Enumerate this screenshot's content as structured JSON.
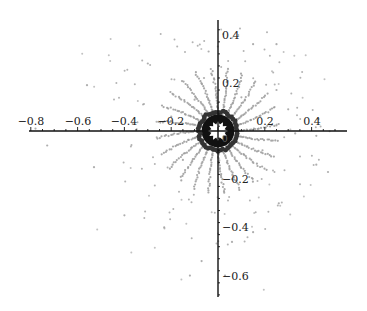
{
  "chart_data": {
    "type": "scatter",
    "title": "",
    "xlabel": "",
    "ylabel": "",
    "xlim": [
      -0.8,
      0.55
    ],
    "ylim": [
      -0.7,
      0.47
    ],
    "grid": false,
    "legend": null,
    "axes_style": "centered at origin (Mathematica-style)",
    "x_ticks": [
      -0.8,
      -0.6,
      -0.4,
      -0.2,
      0.2,
      0.4
    ],
    "x_tick_labels": [
      "−0.8",
      "−0.6",
      "−0.4",
      "−0.2",
      "0.2",
      "0.4"
    ],
    "y_ticks": [
      0.4,
      0.2,
      -0.2,
      -0.4,
      -0.6
    ],
    "y_tick_labels": [
      "0.4",
      "0.2",
      "−0.2",
      "−0.4",
      "−0.6"
    ],
    "point_color": "#9a9a9a",
    "core_color": "#111111",
    "structure": {
      "ring_inner_radius": 0.035,
      "ring_outer_radius": 0.07,
      "spoke_count": 24,
      "spoke_max_radius": 0.26,
      "spoke_twist": 0.6,
      "sparse_points_max_radius": 0.8
    },
    "sample_points": [
      [
        -0.56,
        0.19
      ],
      [
        -0.3,
        0.28
      ],
      [
        -0.04,
        0.33
      ],
      [
        0.15,
        0.36
      ],
      [
        0.25,
        0.36
      ],
      [
        0.3,
        0.09
      ],
      [
        0.43,
        0.05
      ],
      [
        0.25,
        0.17
      ],
      [
        0.33,
        -0.01
      ],
      [
        0.42,
        -0.02
      ],
      [
        0.42,
        -0.14
      ],
      [
        0.47,
        -0.17
      ],
      [
        -0.73,
        -0.06
      ],
      [
        -0.53,
        -0.15
      ],
      [
        -0.4,
        -0.35
      ],
      [
        -0.23,
        -0.4
      ],
      [
        -0.07,
        -0.54
      ],
      [
        -0.12,
        -0.6
      ],
      [
        0.26,
        -0.3
      ],
      [
        0.15,
        -0.42
      ],
      [
        0.06,
        -0.46
      ],
      [
        0.03,
        -0.6
      ],
      [
        -0.06,
        0.22
      ],
      [
        -0.1,
        0.13
      ],
      [
        0.1,
        0.14
      ],
      [
        -0.2,
        0.06
      ],
      [
        0.19,
        -0.08
      ],
      [
        -0.15,
        -0.12
      ],
      [
        0.06,
        -0.2
      ],
      [
        -0.78,
        0.01
      ]
    ]
  }
}
